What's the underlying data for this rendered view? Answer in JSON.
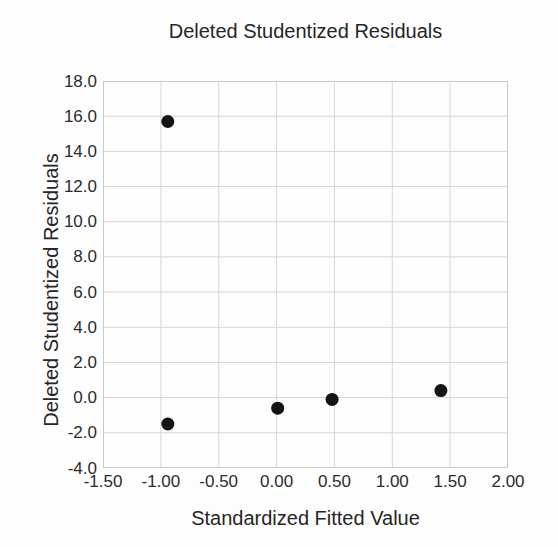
{
  "chart": {
    "title": "Deleted Studentized Residuals",
    "x_axis_title": "Standardized Fitted Value",
    "y_axis_title": "Deleted Studentized Residuals"
  },
  "chart_data": {
    "type": "scatter",
    "title": "Deleted Studentized Residuals",
    "xlabel": "Standardized Fitted Value",
    "ylabel": "Deleted Studentized Residuals",
    "xlim": [
      -1.5,
      2.0
    ],
    "ylim": [
      -4.0,
      18.0
    ],
    "x_tick_values": [
      -1.5,
      -1.0,
      -0.5,
      0.0,
      0.5,
      1.0,
      1.5,
      2.0
    ],
    "x_tick_labels": [
      "-1.50",
      "-1.00",
      "-0.50",
      "0.00",
      "0.50",
      "1.00",
      "1.50",
      "2.00"
    ],
    "y_tick_values": [
      18,
      16,
      14,
      12,
      10,
      8,
      6,
      4,
      2,
      0,
      -2,
      -4
    ],
    "y_tick_labels": [
      "18.0",
      "16.0",
      "14.0",
      "12.0",
      "10.0",
      "8.0",
      "6.0",
      "4.0",
      "2.0",
      "0.0",
      "-2.0",
      "-4.0"
    ],
    "grid": true,
    "legend": false,
    "points": [
      {
        "x": -0.94,
        "y": 15.7
      },
      {
        "x": -0.94,
        "y": -1.5
      },
      {
        "x": 0.01,
        "y": -0.6
      },
      {
        "x": 0.48,
        "y": -0.1
      },
      {
        "x": 1.42,
        "y": 0.4
      }
    ],
    "marker": {
      "shape": "circle",
      "color": "#141414",
      "radius_px": 6.5
    },
    "colors": {
      "gridline": "#d6d6d6",
      "plot_border": "#c8c8c8",
      "text": "#2b2b2b",
      "background": "#fdfdfd"
    }
  }
}
